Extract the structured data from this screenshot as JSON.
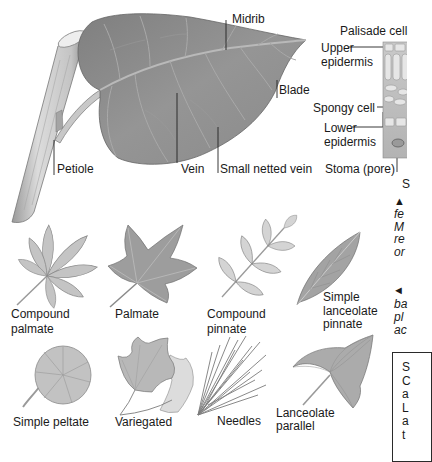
{
  "main_diagram": {
    "title": "Leaf anatomy",
    "labels": {
      "midrib": "Midrib",
      "blade": "Blade",
      "petiole": "Petiole",
      "vein": "Vein",
      "small_netted_vein": "Small netted vein"
    }
  },
  "cross_section": {
    "labels": {
      "palisade_cell": "Palisade cell",
      "upper_epidermis": [
        "Upper",
        "epidermis"
      ],
      "spongy_cell": "Spongy cell",
      "lower_epidermis": [
        "Lower",
        "epidermis"
      ],
      "stoma": "Stoma (pore)",
      "cut_off": "S"
    }
  },
  "leaf_types": [
    {
      "name": [
        "Compound",
        "palmate"
      ]
    },
    {
      "name": [
        "Palmate"
      ]
    },
    {
      "name": [
        "Compound",
        "pinnate"
      ]
    },
    {
      "name": [
        "Simple",
        "lanceolate",
        "pinnate"
      ]
    },
    {
      "name": [
        "Simple peltate"
      ]
    },
    {
      "name": [
        "Variegated"
      ]
    },
    {
      "name": [
        "Needles"
      ]
    },
    {
      "name": [
        "Lanceolate",
        "parallel"
      ]
    }
  ],
  "side_captions": [
    {
      "marker": "▲",
      "lines": [
        "fe",
        "M",
        "re",
        "or"
      ]
    },
    {
      "marker": "◄",
      "lines": [
        "ba",
        "pl",
        "ac"
      ]
    }
  ],
  "sidebar_box": {
    "lines": [
      "S",
      "C",
      "a",
      "L",
      "a",
      "t"
    ]
  },
  "colors": {
    "leaf_dark": "#8f8f8f",
    "leaf_light": "#c6c6c6",
    "stem": "#cfcfcf",
    "label_text": "#1a1a1a",
    "leader_line": "#222222"
  }
}
